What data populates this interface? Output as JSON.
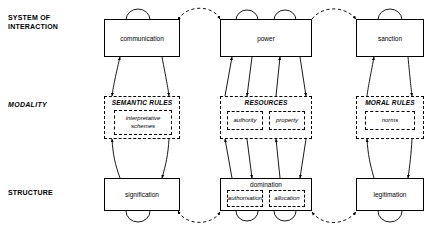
{
  "diagram": {
    "row_labels": [
      {
        "id": "system-of-interaction",
        "text": "SYSTEM OF\nINTERACTION",
        "style": "bold"
      },
      {
        "id": "modality",
        "text": "MODALITY",
        "style": "bold-italic"
      },
      {
        "id": "structure",
        "text": "STRUCTURE",
        "style": "bold"
      }
    ],
    "columns": [
      {
        "id": "signification-column",
        "interaction": "communication",
        "modality": {
          "title": "SEMANTIC RULES",
          "items": [
            "interpretative schemes"
          ]
        },
        "structure": {
          "title": "signification",
          "items": []
        }
      },
      {
        "id": "domination-column",
        "interaction": "power",
        "modality": {
          "title": "RESOURCES",
          "items": [
            "authority",
            "property"
          ]
        },
        "structure": {
          "title": "domination",
          "items": [
            "authorisation",
            "allocation"
          ]
        }
      },
      {
        "id": "legitimation-column",
        "interaction": "sanction",
        "modality": {
          "title": "MORAL RULES",
          "items": [
            "norms"
          ]
        },
        "structure": {
          "title": "legitimation",
          "items": []
        }
      }
    ],
    "colors": {
      "line": "#000000",
      "background": "#ffffff"
    }
  }
}
